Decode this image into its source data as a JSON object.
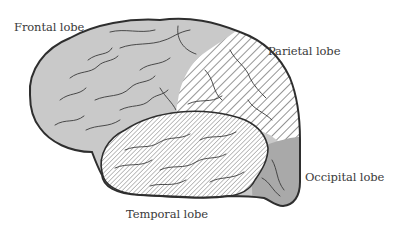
{
  "diagram": {
    "labels": {
      "frontal": "Frontal lobe",
      "parietal": "Parietal lobe",
      "temporal": "Temporal lobe",
      "occipital": "Occipital lobe"
    },
    "colors": {
      "background": "#ffffff",
      "frontal_fill": "#c9c9c9",
      "parietal_fill": "hatch-light",
      "temporal_fill": "hatch-dense",
      "occipital_fill": "#a9a9a9",
      "outline": "#2e2e2e",
      "text": "#3a3a3a"
    }
  }
}
